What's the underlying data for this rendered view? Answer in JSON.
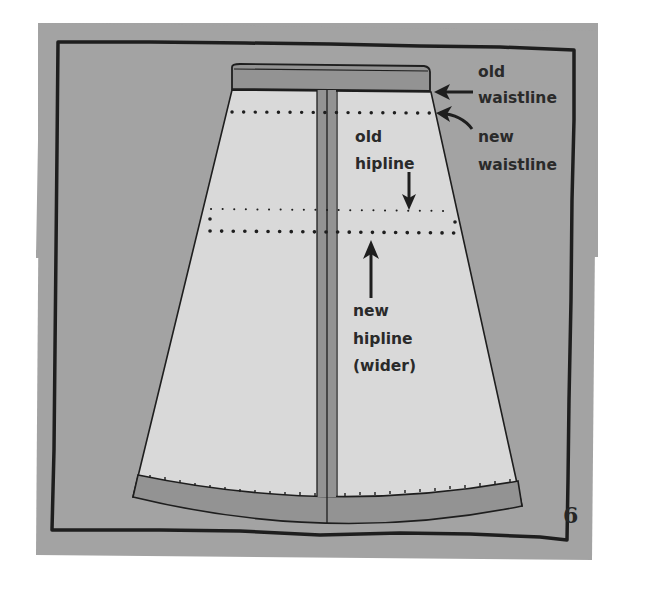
{
  "figure": {
    "number": "6",
    "colors": {
      "page_background": "#ffffff",
      "panel_background": "#a3a3a3",
      "skirt_fabric": "#d9d9d9",
      "waistband_and_hem": "#939393",
      "outline": "#1e1e1e"
    }
  },
  "labels": {
    "old_waistline": {
      "line1": "old",
      "line2": "waistline"
    },
    "new_waistline": {
      "line1": "new",
      "line2": "waistline"
    },
    "old_hipline": {
      "line1": "old",
      "line2": "hipline"
    },
    "new_hipline": {
      "line1": "new",
      "line2": "hipline",
      "line3": "(wider)"
    }
  }
}
